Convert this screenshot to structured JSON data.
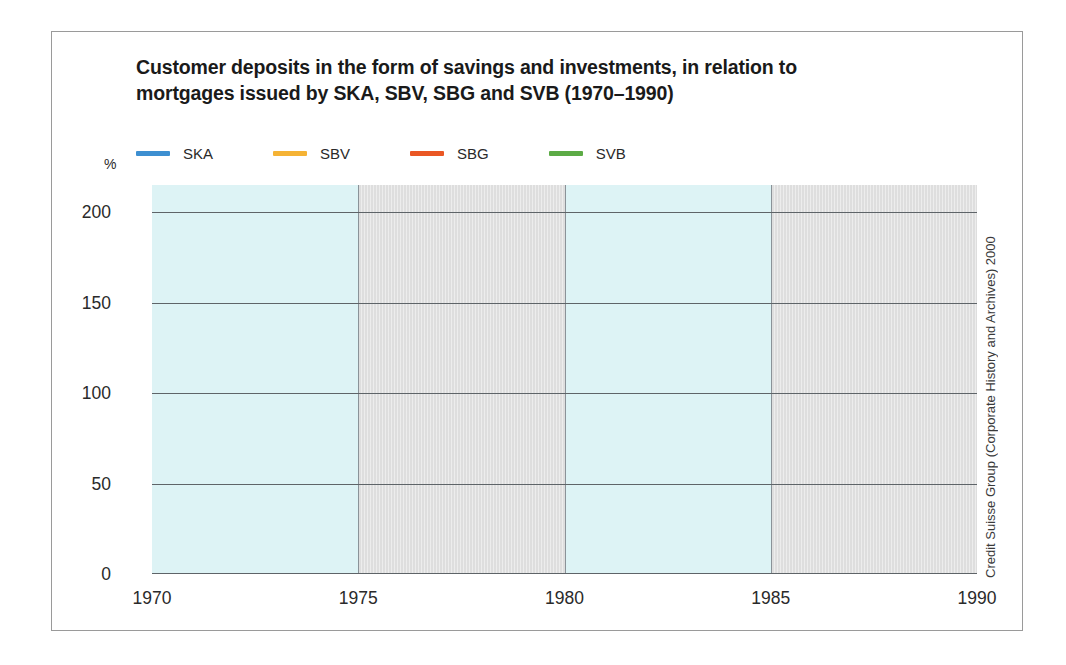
{
  "title": {
    "line1": "Customer deposits in the form of savings and investments, in relation to",
    "line2": "mortgages issued by SKA, SBV, SBG and SVB (1970–1990)"
  },
  "credit": "Credit Suisse Group (Corporate History and Archives) 2000",
  "axis": {
    "y_unit": "%",
    "y_ticks": [
      "200",
      "150",
      "100",
      "50",
      "0"
    ],
    "x_ticks": [
      "1970",
      "1975",
      "1980",
      "1985",
      "1990"
    ]
  },
  "legend": [
    {
      "label": "SKA",
      "color": "#3d8fd1"
    },
    {
      "label": "SBV",
      "color": "#f5b335"
    },
    {
      "label": "SBG",
      "color": "#ea5724"
    },
    {
      "label": "SVB",
      "color": "#5cab46"
    }
  ],
  "chart_data": {
    "type": "line",
    "title": "Customer deposits in the form of savings and investments, in relation to mortgages issued by SKA, SBV, SBG and SVB (1970–1990)",
    "xlabel": "",
    "ylabel": "%",
    "xlim": [
      1970,
      1990
    ],
    "ylim": [
      0,
      215
    ],
    "yticks": [
      0,
      50,
      100,
      150,
      200
    ],
    "xticks": [
      1970,
      1975,
      1980,
      1985,
      1990
    ],
    "grid": "horizontal",
    "legend_position": "top",
    "x": [
      1970,
      1971,
      1972,
      1973,
      1974,
      1975,
      1976,
      1977,
      1978,
      1979,
      1980,
      1981,
      1982,
      1983,
      1984,
      1985,
      1986,
      1987,
      1988,
      1989,
      1990
    ],
    "series": [
      {
        "name": "SKA",
        "color": "#3d8fd1",
        "values": [
          128,
          151,
          149,
          123,
          110,
          116,
          96,
          86,
          83,
          69,
          55,
          47,
          58,
          70,
          70,
          70,
          70,
          71,
          68,
          52,
          47
        ]
      },
      {
        "name": "SBV",
        "color": "#f5b335",
        "values": [
          172,
          207,
          200,
          178,
          158,
          167,
          171,
          174,
          174,
          130,
          98,
          82,
          90,
          90,
          84,
          79,
          76,
          73,
          66,
          50,
          44
        ]
      },
      {
        "name": "SBG",
        "color": "#ea5724",
        "values": [
          112,
          134,
          131,
          114,
          103,
          117,
          114,
          112,
          107,
          88,
          78,
          63,
          74,
          76,
          70,
          67,
          61,
          63,
          63,
          52,
          45
        ]
      },
      {
        "name": "SVB",
        "color": "#5cab46",
        "values": [
          131,
          144,
          150,
          148,
          143,
          151,
          143,
          136,
          128,
          118,
          105,
          89,
          98,
          108,
          104,
          104,
          104,
          100,
          93,
          84,
          77
        ]
      }
    ],
    "background_bands": [
      {
        "from": 1970,
        "to": 1975,
        "color": "#ddf3f5"
      },
      {
        "from": 1975,
        "to": 1980,
        "color": "#dedede"
      },
      {
        "from": 1980,
        "to": 1985,
        "color": "#ddf3f5"
      },
      {
        "from": 1985,
        "to": 1990,
        "color": "#dedede"
      }
    ]
  }
}
